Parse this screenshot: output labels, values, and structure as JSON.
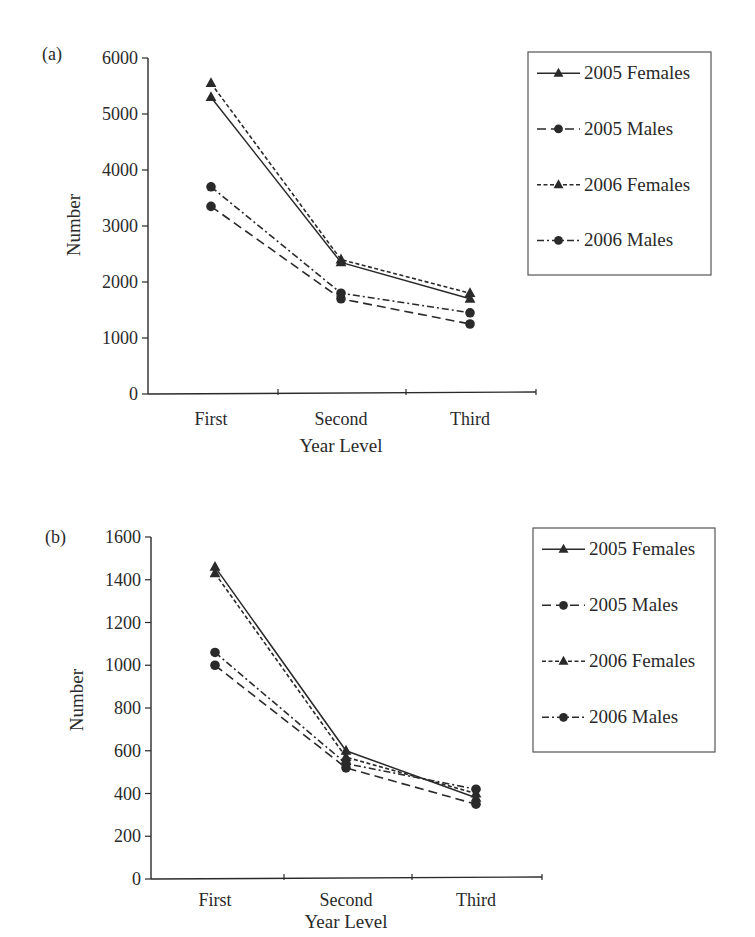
{
  "chart_data": [
    {
      "panel": "(a)",
      "type": "line",
      "title": "",
      "xlabel": "Year Level",
      "ylabel": "Number",
      "categories": [
        "First",
        "Second",
        "Third"
      ],
      "ylim": [
        0,
        6000
      ],
      "yticks": [
        0,
        1000,
        2000,
        3000,
        4000,
        5000,
        6000
      ],
      "grid": false,
      "legend_position": "right",
      "series": [
        {
          "name": "2005 Females",
          "marker": "triangle",
          "line": "solid",
          "values": [
            5300,
            2350,
            1700
          ]
        },
        {
          "name": "2005 Males",
          "marker": "circle",
          "line": "long-dash",
          "values": [
            3350,
            1700,
            1250
          ]
        },
        {
          "name": "2006 Females",
          "marker": "triangle",
          "line": "dotted",
          "values": [
            5550,
            2400,
            1800
          ]
        },
        {
          "name": "2006 Males",
          "marker": "circle",
          "line": "dash-dot",
          "values": [
            3700,
            1800,
            1450
          ]
        }
      ]
    },
    {
      "panel": "(b)",
      "type": "line",
      "title": "",
      "xlabel": "Year Level",
      "ylabel": "Number",
      "categories": [
        "First",
        "Second",
        "Third"
      ],
      "ylim": [
        0,
        1600
      ],
      "yticks": [
        0,
        200,
        400,
        600,
        800,
        1000,
        1200,
        1400,
        1600
      ],
      "grid": false,
      "legend_position": "right",
      "series": [
        {
          "name": "2005 Females",
          "marker": "triangle",
          "line": "solid",
          "values": [
            1460,
            600,
            380
          ]
        },
        {
          "name": "2005 Males",
          "marker": "circle",
          "line": "long-dash",
          "values": [
            1000,
            520,
            350
          ]
        },
        {
          "name": "2006 Females",
          "marker": "triangle",
          "line": "dotted",
          "values": [
            1430,
            570,
            400
          ]
        },
        {
          "name": "2006 Males",
          "marker": "circle",
          "line": "dash-dot",
          "values": [
            1060,
            540,
            420
          ]
        }
      ]
    }
  ],
  "colors": {
    "ink": "#2a2a2a",
    "background": "#ffffff"
  }
}
